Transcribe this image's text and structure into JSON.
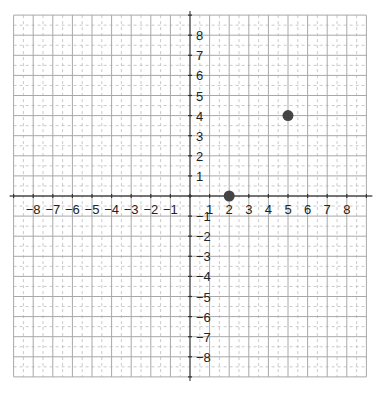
{
  "chart_data": {
    "type": "scatter",
    "title": "",
    "xlabel": "",
    "ylabel": "",
    "xlim": [
      -9,
      9
    ],
    "ylim": [
      -9,
      9
    ],
    "grid": true,
    "minor_grid": "dashed half-units",
    "x_ticks": [
      "-8",
      "-7",
      "-6",
      "-5",
      "-4",
      "-3",
      "-2",
      "-1",
      "1",
      "2",
      "3",
      "4",
      "5",
      "6",
      "7",
      "8"
    ],
    "y_ticks": [
      "8",
      "7",
      "6",
      "5",
      "4",
      "3",
      "2",
      "1",
      "-1",
      "-2",
      "-3",
      "-4",
      "-5",
      "-6",
      "-7",
      "-8"
    ],
    "points": [
      {
        "x": 2,
        "y": 0
      },
      {
        "x": 5,
        "y": 4
      }
    ],
    "point_color": "#444444"
  },
  "layout": {
    "origin_x": 190,
    "origin_y": 196,
    "unit_x": 19.6,
    "unit_y": 20.1
  }
}
